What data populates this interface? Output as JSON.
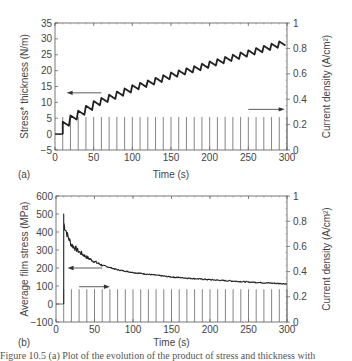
{
  "chart_data": [
    {
      "panel": "(a)",
      "type": "line",
      "xlabel": "Time (s)",
      "ylabel": "Stress* thickness (N/m)",
      "y2label": "Current density (A/cm²)",
      "xlim": [
        0,
        300
      ],
      "ylim": [
        -5,
        35
      ],
      "y2lim": [
        0,
        1
      ],
      "xticks": [
        0,
        50,
        100,
        150,
        200,
        250,
        300
      ],
      "yticks": [
        -5,
        0,
        5,
        10,
        15,
        20,
        25,
        30,
        35
      ],
      "y2ticks": [
        0,
        0.2,
        0.4,
        0.6,
        0.8,
        1
      ],
      "series": [
        {
          "name": "Stress*thickness",
          "axis": "left",
          "x": [
            0,
            10,
            20,
            30,
            40,
            50,
            60,
            70,
            80,
            90,
            100,
            120,
            150,
            180,
            200,
            250,
            300
          ],
          "values": [
            0,
            3,
            5,
            6.5,
            8,
            9.5,
            10.5,
            11.5,
            12.5,
            13.5,
            14.5,
            16,
            18.5,
            20.5,
            22,
            25.5,
            29
          ],
          "shape": "sawtooth steps"
        },
        {
          "name": "Current density pulses",
          "axis": "right",
          "x": [
            10,
            20,
            30,
            40,
            50,
            60,
            70,
            80,
            90,
            100,
            110,
            120,
            130,
            140,
            150,
            160,
            170,
            180,
            190,
            200,
            210,
            220,
            230,
            240,
            250,
            260,
            270,
            280,
            290,
            300
          ],
          "values": [
            0.26
          ],
          "shape": "vertical pulses"
        }
      ],
      "annotations": [
        "arrow left (stress axis) at y≈13",
        "arrow right (current axis) at y≈0.32"
      ]
    },
    {
      "panel": "(b)",
      "type": "line",
      "xlabel": "Time (s)",
      "ylabel": "Average film stress (MPa)",
      "y2label": "Current density (A/cm²)",
      "xlim": [
        0,
        300
      ],
      "ylim": [
        -100,
        600
      ],
      "y2lim": [
        0,
        1
      ],
      "xticks": [
        0,
        50,
        100,
        150,
        200,
        250,
        300
      ],
      "yticks": [
        -100,
        0,
        100,
        200,
        300,
        400,
        500,
        600
      ],
      "y2ticks": [
        0,
        0.2,
        0.4,
        0.6,
        0.8,
        1
      ],
      "series": [
        {
          "name": "Average film stress",
          "axis": "left",
          "x": [
            10,
            15,
            20,
            30,
            40,
            50,
            60,
            80,
            100,
            150,
            200,
            250,
            300
          ],
          "values": [
            450,
            380,
            330,
            290,
            260,
            235,
            215,
            190,
            175,
            150,
            135,
            122,
            112
          ]
        },
        {
          "name": "Current density pulses",
          "axis": "right",
          "x": [
            10,
            20,
            30,
            40,
            50,
            60,
            70,
            80,
            90,
            100,
            110,
            120,
            130,
            140,
            150,
            160,
            170,
            180,
            190,
            200,
            210,
            220,
            230,
            240,
            250,
            260,
            270,
            280,
            290,
            300
          ],
          "values": [
            0.26
          ],
          "shape": "vertical pulses"
        }
      ],
      "annotations": [
        "arrow left (stress axis) at y≈200",
        "arrow right (current axis) at y≈0.28"
      ]
    }
  ],
  "panels": {
    "a": {
      "label": "(a)",
      "xlabel": "Time (s)",
      "ylabel": "Stress* thickness (N/m)",
      "y2label": "Current density (A/cm²)"
    },
    "b": {
      "label": "(b)",
      "xlabel": "Time (s)",
      "ylabel": "Average film stress (MPa)",
      "y2label": "Current density (A/cm²)"
    }
  },
  "caption": "Figure 10.5  (a) Plot of the evolution of the product of stress and thickness with"
}
